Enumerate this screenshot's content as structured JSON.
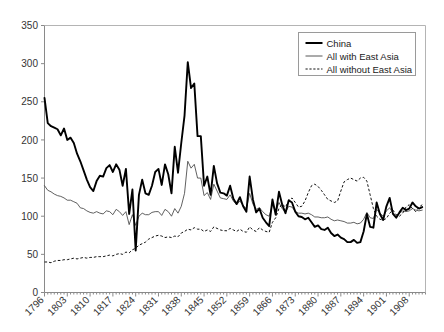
{
  "chart_data": {
    "type": "line",
    "title": "",
    "xlabel": "",
    "ylabel": "",
    "xlim": [
      1796,
      1913
    ],
    "ylim": [
      0,
      350
    ],
    "ytick_step": 50,
    "yticks": [
      0,
      50,
      100,
      150,
      200,
      250,
      300,
      350
    ],
    "xticks": [
      1796,
      1803,
      1810,
      1817,
      1824,
      1831,
      1838,
      1845,
      1852,
      1859,
      1866,
      1873,
      1880,
      1887,
      1894,
      1901,
      1908
    ],
    "xtick_labels": [
      "1796",
      "1803",
      "1810",
      "1817",
      "1824",
      "1831",
      "1838",
      "1845",
      "1852",
      "1859",
      "1866",
      "1873",
      "1880",
      "1887",
      "1894",
      "1901",
      "1908"
    ],
    "grid": false,
    "legend_position": "top-right",
    "legend_entries": [
      {
        "label": "China",
        "style": "solid-thick",
        "color": "#000000"
      },
      {
        "label": "All with East Asia",
        "style": "solid-thin",
        "color": "#444444"
      },
      {
        "label": "All without East Asia",
        "style": "dotted",
        "color": "#111111"
      }
    ],
    "x": [
      1796,
      1797,
      1798,
      1799,
      1800,
      1801,
      1802,
      1803,
      1804,
      1805,
      1806,
      1807,
      1808,
      1809,
      1810,
      1811,
      1812,
      1813,
      1814,
      1815,
      1816,
      1817,
      1818,
      1819,
      1820,
      1821,
      1822,
      1823,
      1824,
      1825,
      1826,
      1827,
      1828,
      1829,
      1830,
      1831,
      1832,
      1833,
      1834,
      1835,
      1836,
      1837,
      1838,
      1839,
      1840,
      1841,
      1842,
      1843,
      1844,
      1845,
      1846,
      1847,
      1848,
      1849,
      1850,
      1851,
      1852,
      1853,
      1854,
      1855,
      1856,
      1857,
      1858,
      1859,
      1860,
      1861,
      1862,
      1863,
      1864,
      1865,
      1866,
      1867,
      1868,
      1869,
      1870,
      1871,
      1872,
      1873,
      1874,
      1875,
      1876,
      1877,
      1878,
      1879,
      1880,
      1881,
      1882,
      1883,
      1884,
      1885,
      1886,
      1887,
      1888,
      1889,
      1890,
      1891,
      1892,
      1893,
      1894,
      1895,
      1896,
      1897,
      1898,
      1899,
      1900,
      1901,
      1902,
      1903,
      1904,
      1905,
      1906,
      1907,
      1908,
      1909,
      1910,
      1911,
      1912
    ],
    "series": [
      {
        "name": "China",
        "style": "solid-thick",
        "values": [
          255,
          222,
          218,
          216,
          214,
          206,
          215,
          200,
          203,
          196,
          182,
          172,
          160,
          148,
          138,
          133,
          146,
          153,
          152,
          163,
          167,
          158,
          168,
          161,
          140,
          162,
          103,
          135,
          55,
          128,
          148,
          130,
          128,
          140,
          158,
          162,
          141,
          168,
          155,
          130,
          191,
          157,
          196,
          232,
          302,
          268,
          274,
          205,
          205,
          140,
          152,
          128,
          166,
          143,
          131,
          130,
          127,
          140,
          123,
          116,
          125,
          113,
          106,
          152,
          122,
          105,
          110,
          98,
          92,
          87,
          122,
          102,
          132,
          115,
          104,
          121,
          118,
          106,
          100,
          99,
          96,
          98,
          92,
          86,
          88,
          83,
          82,
          85,
          78,
          74,
          76,
          72,
          70,
          66,
          66,
          69,
          65,
          66,
          80,
          103,
          86,
          85,
          118,
          103,
          95,
          113,
          124,
          103,
          98,
          105,
          111,
          108,
          110,
          118,
          113,
          110,
          112
        ]
      },
      {
        "name": "All with East Asia",
        "style": "solid-thin",
        "values": [
          140,
          134,
          132,
          129,
          127,
          126,
          124,
          121,
          121,
          119,
          117,
          111,
          110,
          107,
          105,
          104,
          106,
          104,
          103,
          107,
          106,
          102,
          109,
          106,
          101,
          106,
          89,
          102,
          88,
          100,
          104,
          102,
          102,
          105,
          106,
          106,
          101,
          109,
          106,
          100,
          110,
          104,
          113,
          130,
          172,
          163,
          168,
          150,
          150,
          127,
          131,
          122,
          142,
          133,
          124,
          123,
          122,
          128,
          120,
          115,
          120,
          114,
          110,
          130,
          116,
          109,
          111,
          106,
          102,
          100,
          115,
          106,
          118,
          110,
          105,
          113,
          112,
          106,
          104,
          104,
          103,
          104,
          102,
          99,
          99,
          98,
          98,
          99,
          96,
          94,
          95,
          94,
          93,
          91,
          91,
          92,
          90,
          91,
          96,
          105,
          98,
          97,
          109,
          104,
          100,
          107,
          111,
          104,
          101,
          104,
          107,
          106,
          107,
          110,
          108,
          107,
          108
        ]
      },
      {
        "name": "All without East Asia",
        "style": "dotted",
        "values": [
          40,
          40,
          39,
          41,
          42,
          42,
          43,
          43,
          44,
          45,
          44,
          45,
          46,
          45,
          46,
          46,
          47,
          47,
          47,
          48,
          49,
          48,
          50,
          51,
          50,
          53,
          52,
          56,
          58,
          62,
          64,
          66,
          70,
          72,
          74,
          75,
          74,
          72,
          73,
          72,
          74,
          73,
          78,
          80,
          83,
          82,
          85,
          83,
          83,
          80,
          82,
          80,
          86,
          84,
          82,
          81,
          81,
          84,
          82,
          80,
          83,
          80,
          79,
          86,
          82,
          80,
          85,
          82,
          80,
          79,
          92,
          98,
          110,
          116,
          112,
          120,
          124,
          118,
          112,
          113,
          120,
          131,
          140,
          142,
          139,
          134,
          128,
          122,
          120,
          118,
          120,
          133,
          145,
          148,
          150,
          148,
          146,
          150,
          151,
          146,
          128,
          110,
          100,
          96,
          95,
          97,
          104,
          108,
          102,
          100,
          104,
          112,
          115,
          110,
          106,
          112,
          115
        ]
      }
    ]
  }
}
